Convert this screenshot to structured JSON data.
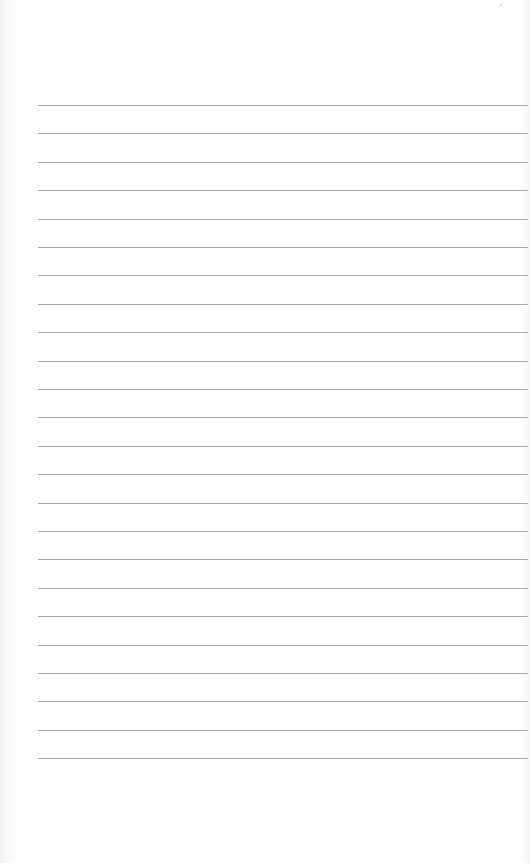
{
  "document": {
    "type": "lined-paper",
    "text": "",
    "colors": {
      "paper": "#ffffff",
      "rule": "#a9a9a9"
    },
    "rules": {
      "count": 24,
      "first_y": 105,
      "spacing": 28.4,
      "left": 38
    }
  }
}
